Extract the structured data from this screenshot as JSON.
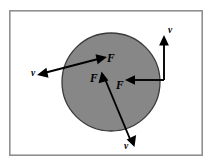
{
  "figure": {
    "name": "force-velocity-circle-diagram",
    "background_color": "#ffffff",
    "frame": {
      "x": 9,
      "y": 10,
      "width": 194,
      "height": 146,
      "stroke_color": "#8f8f8f"
    },
    "disc": {
      "center_x": 111,
      "center_y": 82,
      "radius": 49,
      "fill_color": "#878787",
      "stroke_color": "#3a3a3a"
    },
    "force_labels": [
      {
        "id": "force-top",
        "text": "F",
        "x": 107,
        "y": 62
      },
      {
        "id": "force-left",
        "text": "F",
        "x": 90,
        "y": 82
      },
      {
        "id": "force-right",
        "text": "F",
        "x": 116,
        "y": 89
      }
    ],
    "velocity_labels": [
      {
        "id": "velocity-left",
        "text": "v",
        "x": 31,
        "y": 76
      },
      {
        "id": "velocity-top-right",
        "text": "v",
        "x": 168,
        "y": 33
      },
      {
        "id": "velocity-bottom",
        "text": "v",
        "x": 124,
        "y": 149
      }
    ],
    "vectors": [
      {
        "id": "vector-upper-left",
        "kind": "double-headed",
        "force_head_label": "F",
        "velocity_head_label": "v",
        "tail_x": 40,
        "tail_y": 74,
        "tip_x": 104,
        "tip_y": 57
      },
      {
        "id": "vector-right-bent",
        "kind": "bent-L",
        "force_head_label": "F",
        "velocity_head_label": "v",
        "bend_x": 164,
        "bend_y": 80,
        "horizontal_tip_x": 126,
        "vertical_tip_y": 36
      },
      {
        "id": "vector-lower-left",
        "kind": "double-headed",
        "force_head_label": "F",
        "velocity_head_label": "v",
        "tail_x": 134,
        "tail_y": 143,
        "tip_x": 101,
        "tip_y": 76
      }
    ]
  }
}
